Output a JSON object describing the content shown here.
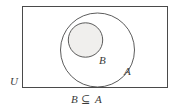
{
  "figure": {
    "type": "venn-diagram",
    "caption": {
      "left_operand": "B",
      "operator": "⊆",
      "right_operand": "A",
      "full": "B ⊆ A"
    },
    "universe": {
      "label": "U",
      "shape": "rectangle",
      "x": 22,
      "y": 6,
      "width": 146,
      "height": 82,
      "fill": "#ffffff",
      "stroke": "#4a4a4a"
    },
    "sets": [
      {
        "label": "A",
        "shape": "circle",
        "cx": 97.5,
        "cy": 50,
        "r": 37.5,
        "fill": "#ffffff",
        "stroke": "#4a4a4a",
        "label_x": 124,
        "label_y": 75
      },
      {
        "label": "B",
        "shape": "circle",
        "cx": 85.5,
        "cy": 40,
        "r": 17.5,
        "fill": "#f0efed",
        "stroke": "#4a4a4a",
        "label_x": 99,
        "label_y": 64
      }
    ],
    "colors": {
      "background": "#ffffff",
      "stroke": "#4a4a4a",
      "text": "#3a3a3a",
      "subset_fill": "#f0efed"
    }
  }
}
